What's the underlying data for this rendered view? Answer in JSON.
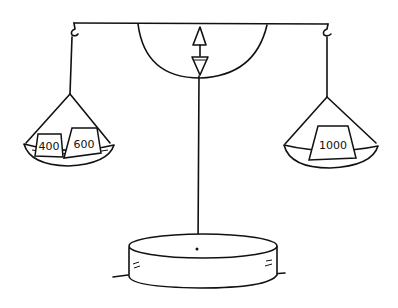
{
  "figure": {
    "line_color": "#111111",
    "background": "#ffffff"
  },
  "left_pan": {
    "weights": [
      {
        "label": "400"
      },
      {
        "label": "600"
      }
    ]
  },
  "right_pan": {
    "weights": [
      {
        "label": "1000"
      }
    ]
  }
}
